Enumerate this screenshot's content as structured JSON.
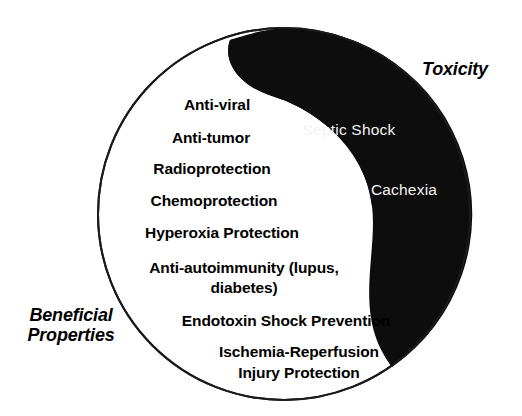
{
  "figure": {
    "type": "yin-yang-diagram",
    "colors": {
      "background": "#ffffff",
      "dark_half": "#0d0d0d",
      "light_half": "#ffffff",
      "outline": "#1a1a1a",
      "dark_text": "#000000",
      "light_text": "#f2f2f2"
    },
    "circle": {
      "cx": 284,
      "cy": 214,
      "r": 186
    }
  },
  "captions": {
    "beneficial": {
      "line1": "Beneficial",
      "line2": "Properties"
    },
    "toxicity": {
      "line1": "Toxicity"
    }
  },
  "beneficial_properties": [
    {
      "label": "Anti-viral",
      "x": 217,
      "y": 105
    },
    {
      "label": "Anti-tumor",
      "x": 211,
      "y": 138
    },
    {
      "label": "Radioprotection",
      "x": 212,
      "y": 169
    },
    {
      "label": "Chemoprotection",
      "x": 214,
      "y": 201
    },
    {
      "label": "Hyperoxia Protection",
      "x": 222,
      "y": 233
    },
    {
      "label": "Anti-autoimmunity (lupus,",
      "x": 244,
      "y": 268
    },
    {
      "label": "diabetes)",
      "x": 244,
      "y": 288
    },
    {
      "label": "Endotoxin Shock Prevention",
      "x": 286,
      "y": 321
    },
    {
      "label": "Ischemia-Reperfusion",
      "x": 299,
      "y": 352
    },
    {
      "label": "Injury Protection",
      "x": 299,
      "y": 373
    }
  ],
  "toxicity_effects": [
    {
      "label": "Septic Shock",
      "x": 349,
      "y": 130
    },
    {
      "label": "Cachexia",
      "x": 404,
      "y": 190
    }
  ]
}
